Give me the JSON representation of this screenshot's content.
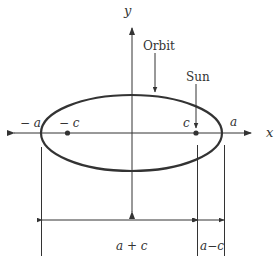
{
  "diagram": {
    "type": "ellipse-orbit",
    "axes": {
      "x_label": "x",
      "y_label": "y"
    },
    "labels": {
      "orbit": "Orbit",
      "sun": "Sun",
      "neg_a": "− a",
      "neg_c": "− c",
      "c": "c",
      "a": "a",
      "a_plus_c": "a + c",
      "a_minus_c": "a−c"
    },
    "colors": {
      "stroke": "#333333",
      "background": "#ffffff"
    }
  }
}
